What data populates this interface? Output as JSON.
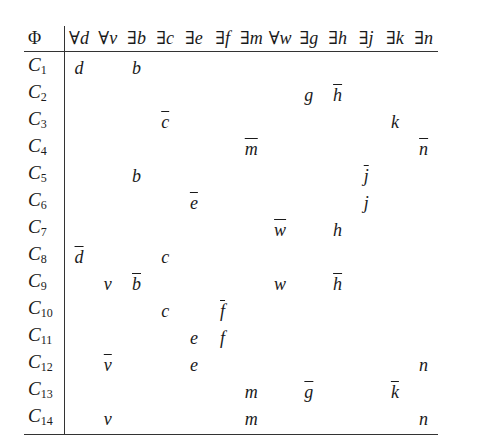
{
  "table": {
    "corner_label": "Φ",
    "columns": [
      {
        "quantifier": "∀",
        "variable": "d"
      },
      {
        "quantifier": "∀",
        "variable": "v"
      },
      {
        "quantifier": "∃",
        "variable": "b"
      },
      {
        "quantifier": "∃",
        "variable": "c"
      },
      {
        "quantifier": "∃",
        "variable": "e"
      },
      {
        "quantifier": "∃",
        "variable": "f"
      },
      {
        "quantifier": "∃",
        "variable": "m"
      },
      {
        "quantifier": "∀",
        "variable": "w"
      },
      {
        "quantifier": "∃",
        "variable": "g"
      },
      {
        "quantifier": "∃",
        "variable": "h"
      },
      {
        "quantifier": "∃",
        "variable": "j"
      },
      {
        "quantifier": "∃",
        "variable": "k"
      },
      {
        "quantifier": "∃",
        "variable": "n"
      }
    ],
    "rows": [
      {
        "label": "C",
        "index": "1",
        "cells": [
          {
            "v": "d"
          },
          {
            "v": ""
          },
          {
            "v": "b"
          },
          {
            "v": ""
          },
          {
            "v": ""
          },
          {
            "v": ""
          },
          {
            "v": ""
          },
          {
            "v": ""
          },
          {
            "v": ""
          },
          {
            "v": ""
          },
          {
            "v": ""
          },
          {
            "v": ""
          },
          {
            "v": ""
          }
        ]
      },
      {
        "label": "C",
        "index": "2",
        "cells": [
          {
            "v": ""
          },
          {
            "v": ""
          },
          {
            "v": ""
          },
          {
            "v": ""
          },
          {
            "v": ""
          },
          {
            "v": ""
          },
          {
            "v": ""
          },
          {
            "v": ""
          },
          {
            "v": "g"
          },
          {
            "v": "h",
            "neg": true
          },
          {
            "v": ""
          },
          {
            "v": ""
          },
          {
            "v": ""
          }
        ]
      },
      {
        "label": "C",
        "index": "3",
        "cells": [
          {
            "v": ""
          },
          {
            "v": ""
          },
          {
            "v": ""
          },
          {
            "v": "c",
            "neg": true
          },
          {
            "v": ""
          },
          {
            "v": ""
          },
          {
            "v": ""
          },
          {
            "v": ""
          },
          {
            "v": ""
          },
          {
            "v": ""
          },
          {
            "v": ""
          },
          {
            "v": "k"
          },
          {
            "v": ""
          }
        ]
      },
      {
        "label": "C",
        "index": "4",
        "cells": [
          {
            "v": ""
          },
          {
            "v": ""
          },
          {
            "v": ""
          },
          {
            "v": ""
          },
          {
            "v": ""
          },
          {
            "v": ""
          },
          {
            "v": "m",
            "neg": true
          },
          {
            "v": ""
          },
          {
            "v": ""
          },
          {
            "v": ""
          },
          {
            "v": ""
          },
          {
            "v": ""
          },
          {
            "v": "n",
            "neg": true
          }
        ]
      },
      {
        "label": "C",
        "index": "5",
        "cells": [
          {
            "v": ""
          },
          {
            "v": ""
          },
          {
            "v": "b"
          },
          {
            "v": ""
          },
          {
            "v": ""
          },
          {
            "v": ""
          },
          {
            "v": ""
          },
          {
            "v": ""
          },
          {
            "v": ""
          },
          {
            "v": ""
          },
          {
            "v": "j",
            "neg": true
          },
          {
            "v": ""
          },
          {
            "v": ""
          }
        ]
      },
      {
        "label": "C",
        "index": "6",
        "cells": [
          {
            "v": ""
          },
          {
            "v": ""
          },
          {
            "v": ""
          },
          {
            "v": ""
          },
          {
            "v": "e",
            "neg": true
          },
          {
            "v": ""
          },
          {
            "v": ""
          },
          {
            "v": ""
          },
          {
            "v": ""
          },
          {
            "v": ""
          },
          {
            "v": "j"
          },
          {
            "v": ""
          },
          {
            "v": ""
          }
        ]
      },
      {
        "label": "C",
        "index": "7",
        "cells": [
          {
            "v": ""
          },
          {
            "v": ""
          },
          {
            "v": ""
          },
          {
            "v": ""
          },
          {
            "v": ""
          },
          {
            "v": ""
          },
          {
            "v": ""
          },
          {
            "v": "w",
            "neg": true
          },
          {
            "v": ""
          },
          {
            "v": "h"
          },
          {
            "v": ""
          },
          {
            "v": ""
          },
          {
            "v": ""
          }
        ]
      },
      {
        "label": "C",
        "index": "8",
        "cells": [
          {
            "v": "d",
            "neg": true
          },
          {
            "v": ""
          },
          {
            "v": ""
          },
          {
            "v": "c"
          },
          {
            "v": ""
          },
          {
            "v": ""
          },
          {
            "v": ""
          },
          {
            "v": ""
          },
          {
            "v": ""
          },
          {
            "v": ""
          },
          {
            "v": ""
          },
          {
            "v": ""
          },
          {
            "v": ""
          }
        ]
      },
      {
        "label": "C",
        "index": "9",
        "cells": [
          {
            "v": ""
          },
          {
            "v": "v"
          },
          {
            "v": "b",
            "neg": true
          },
          {
            "v": ""
          },
          {
            "v": ""
          },
          {
            "v": ""
          },
          {
            "v": ""
          },
          {
            "v": "w"
          },
          {
            "v": ""
          },
          {
            "v": "h",
            "neg": true
          },
          {
            "v": ""
          },
          {
            "v": ""
          },
          {
            "v": ""
          }
        ]
      },
      {
        "label": "C",
        "index": "10",
        "cells": [
          {
            "v": ""
          },
          {
            "v": ""
          },
          {
            "v": ""
          },
          {
            "v": "c"
          },
          {
            "v": ""
          },
          {
            "v": "f",
            "neg": true
          },
          {
            "v": ""
          },
          {
            "v": ""
          },
          {
            "v": ""
          },
          {
            "v": ""
          },
          {
            "v": ""
          },
          {
            "v": ""
          },
          {
            "v": ""
          }
        ]
      },
      {
        "label": "C",
        "index": "11",
        "cells": [
          {
            "v": ""
          },
          {
            "v": ""
          },
          {
            "v": ""
          },
          {
            "v": ""
          },
          {
            "v": "e"
          },
          {
            "v": "f"
          },
          {
            "v": ""
          },
          {
            "v": ""
          },
          {
            "v": ""
          },
          {
            "v": ""
          },
          {
            "v": ""
          },
          {
            "v": ""
          },
          {
            "v": ""
          }
        ]
      },
      {
        "label": "C",
        "index": "12",
        "cells": [
          {
            "v": ""
          },
          {
            "v": "v",
            "neg": true
          },
          {
            "v": ""
          },
          {
            "v": ""
          },
          {
            "v": "e"
          },
          {
            "v": ""
          },
          {
            "v": ""
          },
          {
            "v": ""
          },
          {
            "v": ""
          },
          {
            "v": ""
          },
          {
            "v": ""
          },
          {
            "v": ""
          },
          {
            "v": "n"
          }
        ]
      },
      {
        "label": "C",
        "index": "13",
        "cells": [
          {
            "v": ""
          },
          {
            "v": ""
          },
          {
            "v": ""
          },
          {
            "v": ""
          },
          {
            "v": ""
          },
          {
            "v": ""
          },
          {
            "v": "m"
          },
          {
            "v": ""
          },
          {
            "v": "g",
            "neg": true
          },
          {
            "v": ""
          },
          {
            "v": ""
          },
          {
            "v": "k",
            "neg": true
          },
          {
            "v": ""
          }
        ]
      },
      {
        "label": "C",
        "index": "14",
        "cells": [
          {
            "v": ""
          },
          {
            "v": "v"
          },
          {
            "v": ""
          },
          {
            "v": ""
          },
          {
            "v": ""
          },
          {
            "v": ""
          },
          {
            "v": "m"
          },
          {
            "v": ""
          },
          {
            "v": ""
          },
          {
            "v": ""
          },
          {
            "v": ""
          },
          {
            "v": ""
          },
          {
            "v": "n"
          }
        ]
      }
    ]
  }
}
